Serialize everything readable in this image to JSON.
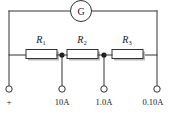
{
  "figure": {
    "meter": {
      "name": "galvanometer",
      "label": "G"
    },
    "resistors": [
      {
        "id": "R1",
        "symbol": "R",
        "subscript": "1"
      },
      {
        "id": "R2",
        "symbol": "R",
        "subscript": "2"
      },
      {
        "id": "R3",
        "symbol": "R",
        "subscript": "3"
      }
    ],
    "terminals": [
      {
        "id": "common",
        "label": "+"
      },
      {
        "id": "range-10a",
        "label": "10A"
      },
      {
        "id": "range-1a",
        "label": "1.0A"
      },
      {
        "id": "range-0.1a",
        "label": "0.10A"
      }
    ],
    "colors": {
      "line": "#333333",
      "text": "#1a1a1a",
      "shadow": "#b9b9b9",
      "background": "#ffffff"
    }
  }
}
